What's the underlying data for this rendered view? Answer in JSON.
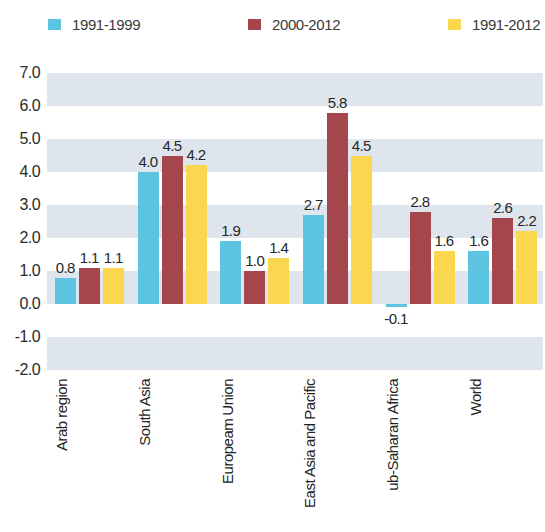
{
  "legend": {
    "items": [
      {
        "label": "1991-1999",
        "color": "#5cc3e0"
      },
      {
        "label": "2000-2012",
        "color": "#a5454c"
      },
      {
        "label": "1991-2012",
        "color": "#fad74f"
      }
    ]
  },
  "yaxis": {
    "ticks": [
      "7.0",
      "6.0",
      "5.0",
      "4.0",
      "3.0",
      "2.0",
      "1.0",
      "0.0",
      "-1.0",
      "-2.0"
    ]
  },
  "categories": [
    {
      "lines": [
        "Arab region"
      ]
    },
    {
      "lines": [
        "South Asia"
      ]
    },
    {
      "lines": [
        "Europeam",
        "Union"
      ]
    },
    {
      "lines": [
        "East Asia",
        "and Pacific"
      ]
    },
    {
      "lines": [
        "ub-Saharan",
        "Africa"
      ]
    },
    {
      "lines": [
        "World"
      ]
    }
  ],
  "chart_data": {
    "type": "bar",
    "title": "",
    "xlabel": "",
    "ylabel": "",
    "ylim": [
      -2.0,
      7.0
    ],
    "ytick_step": 1.0,
    "grid": "alternating-horizontal-bands",
    "legend_position": "top",
    "categories": [
      "Arab region",
      "South Asia",
      "Europeam Union",
      "East Asia and Pacific",
      "ub-Saharan Africa",
      "World"
    ],
    "series": [
      {
        "name": "1991-1999",
        "color": "#5cc3e0",
        "values": [
          0.8,
          4.0,
          1.9,
          2.7,
          -0.1,
          1.6
        ],
        "labels": [
          "0.8",
          "4.0",
          "1.9",
          "2.7",
          "-0.1",
          "1.6"
        ]
      },
      {
        "name": "2000-2012",
        "color": "#a5454c",
        "values": [
          1.1,
          4.5,
          1.0,
          5.8,
          2.8,
          2.6
        ],
        "labels": [
          "1.1",
          "4.5",
          "1.0",
          "5.8",
          "2.8",
          "2.6"
        ]
      },
      {
        "name": "1991-2012",
        "color": "#fad74f",
        "values": [
          1.1,
          4.2,
          1.4,
          4.5,
          1.6,
          2.2
        ],
        "labels": [
          "1.1",
          "4.2",
          "1.4",
          "4.5",
          "1.6",
          "2.2"
        ]
      }
    ]
  }
}
